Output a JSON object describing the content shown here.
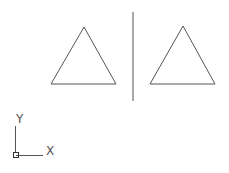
{
  "canvas": {
    "background": "#ffffff",
    "stroke_color": "#555555",
    "objects": [
      {
        "type": "triangle",
        "name": "left-triangle",
        "points": [
          [
            84,
            27
          ],
          [
            51,
            84
          ],
          [
            116,
            84
          ]
        ]
      },
      {
        "type": "line",
        "name": "mirror-line",
        "from": [
          133,
          12
        ],
        "to": [
          133,
          101
        ]
      },
      {
        "type": "triangle",
        "name": "right-triangle",
        "points": [
          [
            183,
            26
          ],
          [
            150,
            84
          ],
          [
            215,
            84
          ]
        ]
      }
    ]
  },
  "ucs_icon": {
    "x_label": "X",
    "y_label": "Y"
  }
}
